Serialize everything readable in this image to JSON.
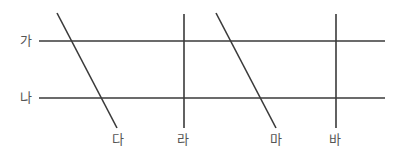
{
  "diagram": {
    "line_color": "#3a3a3a",
    "label_color": "#555555",
    "horizontal_lines": [
      {
        "label": "가",
        "x1": 39,
        "x2": 385,
        "y": 41,
        "label_x": 20,
        "label_y": 34
      },
      {
        "label": "나",
        "x1": 39,
        "x2": 385,
        "y": 98,
        "label_x": 20,
        "label_y": 91
      }
    ],
    "transversals": [
      {
        "label": "다",
        "x1": 57,
        "y1": 13,
        "x2": 117,
        "y2": 128,
        "label_x": 112,
        "label_y": 133
      },
      {
        "label": "라",
        "x1": 184,
        "y1": 14,
        "x2": 184,
        "y2": 128,
        "label_x": 177,
        "label_y": 133
      },
      {
        "label": "마",
        "x1": 216,
        "y1": 13,
        "x2": 276,
        "y2": 128,
        "label_x": 270,
        "label_y": 133
      },
      {
        "label": "바",
        "x1": 336,
        "y1": 14,
        "x2": 336,
        "y2": 128,
        "label_x": 329,
        "label_y": 133
      }
    ]
  }
}
